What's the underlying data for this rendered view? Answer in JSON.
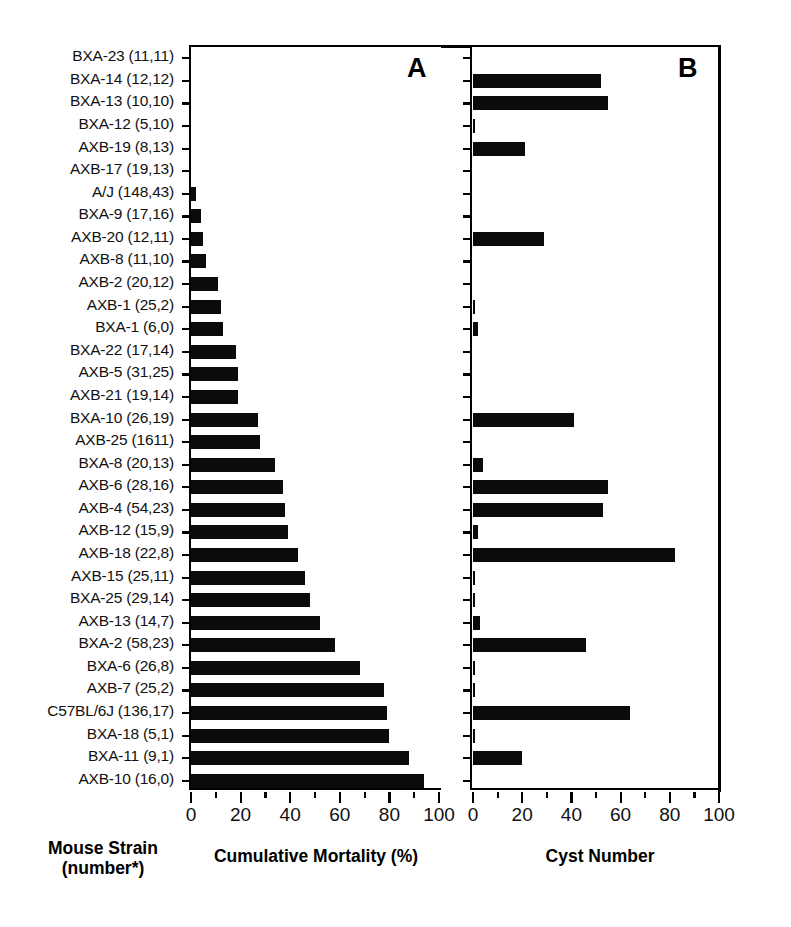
{
  "figure": {
    "panel_a_letter": "A",
    "panel_b_letter": "B",
    "caption_strain": "Mouse Strain\n(number*)",
    "caption_strain_line1": "Mouse Strain",
    "caption_strain_line2": "(number*)",
    "caption_mortality": "Cumulative Mortality (%)",
    "caption_cyst": "Cyst Number",
    "bar_color": "#0b0b0b",
    "axis_color": "#000000",
    "background": "#ffffff"
  },
  "chart_data": {
    "type": "bar",
    "title": "",
    "orientation": "horizontal",
    "panels": [
      {
        "letter": "A",
        "xlabel": "Cumulative Mortality (%)",
        "xlim": [
          0,
          110
        ],
        "xticks": [
          0,
          20,
          40,
          60,
          80,
          100
        ],
        "xticklabels": [
          "0",
          "20",
          "40",
          "60",
          "80",
          "100"
        ],
        "minor_tick_step": 10,
        "grid": false
      },
      {
        "letter": "B",
        "xlabel": "Cyst Number",
        "xlim": [
          0,
          102
        ],
        "xticks": [
          0,
          20,
          40,
          60,
          80,
          100
        ],
        "xticklabels": [
          "0",
          "20",
          "40",
          "60",
          "80",
          "100"
        ],
        "minor_tick_step": 10,
        "grid": false
      }
    ],
    "ylabel": "Mouse Strain (number*)",
    "categories": [
      "BXA-23 (11,11)",
      "BXA-14 (12,12)",
      "BXA-13 (10,10)",
      "BXA-12 (5,10)",
      "AXB-19 (8,13)",
      "AXB-17 (19,13)",
      "A/J (148,43)",
      "BXA-9 (17,16)",
      "AXB-20 (12,11)",
      "AXB-8 (11,10)",
      "AXB-2 (20,12)",
      "AXB-1 (25,2)",
      "BXA-1 (6,0)",
      "BXA-22 (17,14)",
      "AXB-5 (31,25)",
      "AXB-21 (19,14)",
      "BXA-10 (26,19)",
      "AXB-25 (1611)",
      "BXA-8 (20,13)",
      "AXB-6 (28,16)",
      "AXB-4 (54,23)",
      "AXB-12 (15,9)",
      "AXB-18 (22,8)",
      "AXB-15 (25,11)",
      "BXA-25 (29,14)",
      "AXB-13 (14,7)",
      "BXA-2 (58,23)",
      "BXA-6 (26,8)",
      "AXB-7 (25,2)",
      "C57BL/6J (136,17)",
      "BXA-18 (5,1)",
      "BXA-11 (9,1)",
      "AXB-10 (16,0)"
    ],
    "series": [
      {
        "name": "Cumulative Mortality (%)",
        "panel": "A",
        "values": [
          0,
          0,
          0,
          0,
          0,
          0,
          2,
          4,
          5,
          6,
          11,
          12,
          13,
          18,
          19,
          19,
          27,
          28,
          34,
          37,
          38,
          39,
          43,
          46,
          48,
          52,
          58,
          68,
          78,
          79,
          80,
          88,
          94
        ]
      },
      {
        "name": "Cyst Number",
        "panel": "B",
        "values": [
          0,
          52,
          55,
          1,
          21,
          0,
          0,
          0,
          29,
          0,
          0,
          1,
          2,
          0,
          0,
          0,
          41,
          0,
          4,
          55,
          53,
          2,
          82,
          1,
          1,
          3,
          46,
          1,
          1,
          64,
          1,
          20,
          0
        ]
      }
    ]
  }
}
